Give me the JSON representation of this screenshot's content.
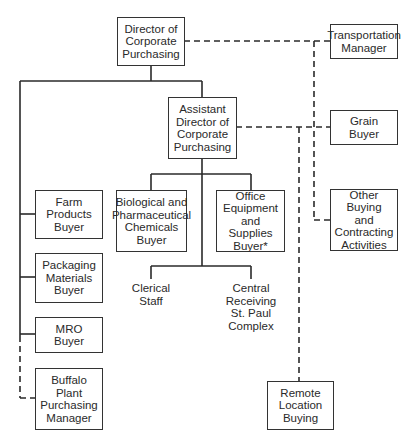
{
  "diagram": {
    "type": "organization-chart",
    "nodes": {
      "director": "Director of\nCorporate\nPurchasing",
      "transportation": "Transportation\nManager",
      "assistant": "Assistant\nDirector of\nCorporate\nPurchasing",
      "grain": "Grain\nBuyer",
      "other_buying": "Other Buying\nand\nContracting\nActivities",
      "farm": "Farm\nProducts\nBuyer",
      "packaging": "Packaging\nMaterials\nBuyer",
      "mro": "MRO\nBuyer",
      "buffalo": "Buffalo\nPlant\nPurchasing\nManager",
      "biological": "Biological and\nPharmaceutical\nChemicals\nBuyer",
      "office": "Office\nEquipment\nand Supplies\nBuyer*",
      "clerical": "Clerical\nStaff",
      "central": "Central\nReceiving\nSt. Paul\nComplex",
      "remote": "Remote\nLocation\nBuying"
    },
    "edges": [
      {
        "from": "director",
        "to": "assistant",
        "style": "solid"
      },
      {
        "from": "director",
        "to": "farm",
        "style": "solid"
      },
      {
        "from": "director",
        "to": "packaging",
        "style": "solid"
      },
      {
        "from": "director",
        "to": "mro",
        "style": "solid"
      },
      {
        "from": "director",
        "to": "buffalo",
        "style": "dashed"
      },
      {
        "from": "director",
        "to": "transportation",
        "style": "dashed"
      },
      {
        "from": "director",
        "to": "grain",
        "style": "dashed"
      },
      {
        "from": "director",
        "to": "other_buying",
        "style": "dashed"
      },
      {
        "from": "assistant",
        "to": "biological",
        "style": "solid"
      },
      {
        "from": "assistant",
        "to": "office",
        "style": "solid"
      },
      {
        "from": "assistant",
        "to": "clerical",
        "style": "solid"
      },
      {
        "from": "assistant",
        "to": "central",
        "style": "solid"
      },
      {
        "from": "assistant",
        "to": "grain",
        "style": "dashed"
      },
      {
        "from": "assistant",
        "to": "remote",
        "style": "dashed"
      }
    ],
    "colors": {
      "line": "#2a2a2a",
      "background": "#ffffff"
    }
  }
}
